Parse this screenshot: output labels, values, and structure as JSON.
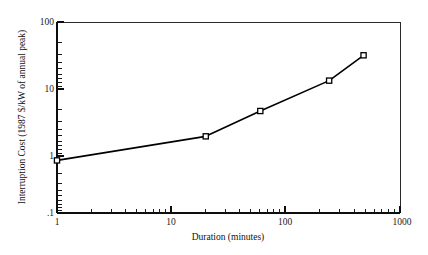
{
  "chart_data": {
    "type": "line",
    "title": "",
    "xlabel": "Duration (minutes)",
    "ylabel": "Interruption Cost (1987 $/kW of annual peak)",
    "xscale": "log",
    "yscale": "log",
    "xlim": [
      1,
      1000
    ],
    "ylim": [
      0.1,
      100
    ],
    "grid": false,
    "legend": false,
    "xticks": [
      1,
      10,
      100,
      1000
    ],
    "xtick_labels": [
      "1",
      "10",
      "100",
      "1000"
    ],
    "yticks": [
      0.1,
      1,
      10,
      100
    ],
    "ytick_labels": [
      ".1",
      "1",
      "10",
      "100"
    ],
    "marker": "open-square",
    "series": [
      {
        "name": "Interruption Cost",
        "x": [
          1,
          20,
          60,
          240,
          480
        ],
        "values": [
          0.67,
          1.6,
          4.0,
          12.0,
          30.0
        ]
      }
    ]
  },
  "figure": {
    "background_color": "#ffffff",
    "line_color": "#000000",
    "axis_color": "#0d0d0d"
  }
}
